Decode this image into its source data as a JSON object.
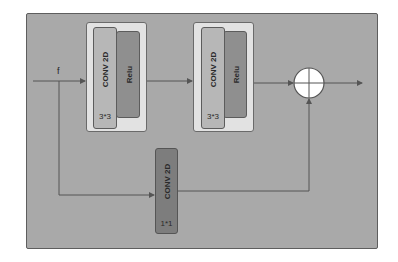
{
  "diagram": {
    "input_label": "f",
    "blocks": [
      {
        "conv_label": "CONV 2D",
        "kernel_label": "3*3",
        "activation_label": "Relu"
      },
      {
        "conv_label": "CONV 2D",
        "kernel_label": "3*3",
        "activation_label": "Relu"
      }
    ],
    "skip_conv": {
      "conv_label": "CONV 2D",
      "kernel_label": "1*1"
    },
    "merge_operator": "add"
  },
  "colors": {
    "panel": "#a9a9a9",
    "block_bg": "#e2e2e2",
    "conv": "#b7b7b7",
    "relu": "#8f8f8f",
    "conv1x1": "#7d7d7d",
    "line": "#555555",
    "merge_fill": "#ffffff"
  }
}
